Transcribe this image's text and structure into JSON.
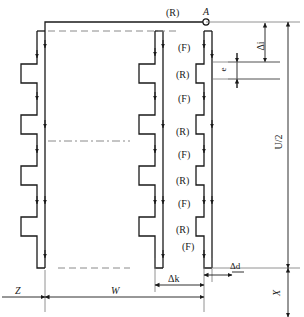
{
  "figure": {
    "type": "technical-diagram",
    "terminal_label": "A",
    "flow_labels": {
      "forward": "(F)",
      "reverse": "(R)"
    },
    "center_column_sequence": [
      "(R)",
      "(F)",
      "(R)",
      "(F)",
      "(R)",
      "(F)",
      "(R)",
      "(F)",
      "(R)",
      "(F)"
    ],
    "dimensions": {
      "pitch_large": "Δi",
      "conductor_width": "e",
      "half_period": "U/2",
      "right_offset": "X",
      "left_offset": "Z",
      "overall_width": "W",
      "gap_k": "Δk",
      "gap_d": "Δd"
    },
    "colors": {
      "line": "#1a1a1a",
      "thin": "#777777",
      "dash": "#8a8a8a",
      "background": "#ffffff"
    }
  }
}
